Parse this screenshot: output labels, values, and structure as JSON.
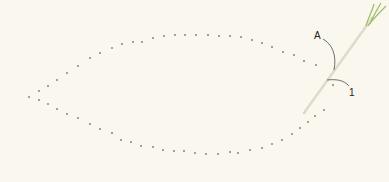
{
  "diagram": {
    "background": "#faf7ef",
    "dot_color": "#8a8378",
    "needle_color": "#d8d2c0",
    "thread_color": "#9bbf6a",
    "labels": {
      "a": {
        "text": "A",
        "x": 316,
        "y": 32
      },
      "one": {
        "text": "1",
        "x": 350,
        "y": 89
      }
    },
    "outline_dots": {
      "left_tip": [
        29,
        97
      ],
      "upper_arc": [
        [
          39,
          91
        ],
        [
          48,
          86
        ],
        [
          57,
          80
        ],
        [
          67,
          73
        ],
        [
          78,
          66
        ],
        [
          90,
          58
        ],
        [
          100,
          53
        ],
        [
          112,
          48
        ],
        [
          122,
          44
        ],
        [
          133,
          42
        ],
        [
          142,
          42
        ],
        [
          153,
          38
        ],
        [
          164,
          36
        ],
        [
          175,
          35
        ],
        [
          185,
          35
        ],
        [
          196,
          35
        ],
        [
          208,
          35
        ],
        [
          219,
          36
        ],
        [
          230,
          36
        ],
        [
          241,
          37
        ],
        [
          252,
          40
        ],
        [
          262,
          43
        ],
        [
          272,
          47
        ],
        [
          283,
          52
        ],
        [
          294,
          55
        ],
        [
          304,
          61
        ],
        [
          316,
          65
        ]
      ],
      "lower_arc": [
        [
          39,
          100
        ],
        [
          48,
          104
        ],
        [
          57,
          109
        ],
        [
          67,
          114
        ],
        [
          78,
          118
        ],
        [
          90,
          124
        ],
        [
          100,
          129
        ],
        [
          112,
          133
        ],
        [
          121,
          140
        ],
        [
          131,
          142
        ],
        [
          141,
          146
        ],
        [
          153,
          147
        ],
        [
          163,
          150
        ],
        [
          174,
          151
        ],
        [
          184,
          151
        ],
        [
          195,
          153
        ],
        [
          206,
          154
        ],
        [
          218,
          154
        ],
        [
          230,
          152
        ],
        [
          238,
          153
        ],
        [
          250,
          150
        ],
        [
          262,
          148
        ],
        [
          272,
          144
        ],
        [
          282,
          140
        ],
        [
          292,
          134
        ],
        [
          300,
          128
        ],
        [
          308,
          122
        ],
        [
          315,
          116
        ]
      ],
      "right_side": [
        [
          333,
          85
        ],
        [
          324,
          110
        ]
      ]
    }
  }
}
